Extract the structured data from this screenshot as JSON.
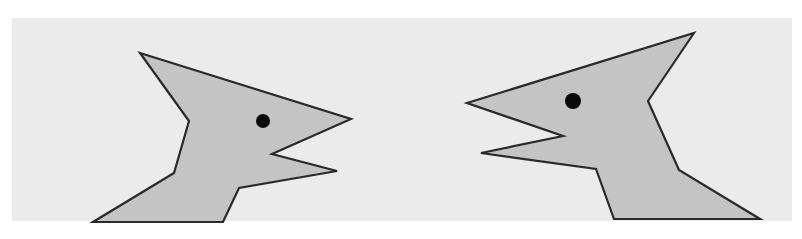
{
  "scene": {
    "description": "Two stylized angular bird-like heads facing each other with open beaks",
    "colors": {
      "page_background": "#ffffff",
      "panel_background": "#ebebeb",
      "figure_fill": "#c4c4c4",
      "outline": "#2a2a2a",
      "eye": "#0a0a0a"
    },
    "figures": [
      {
        "id": "left-head",
        "facing": "right",
        "points": "140,53 351,119 272,154 337,171 239,188 223,222 93,222 174,173 189,121",
        "eye": {
          "cx": 263,
          "cy": 121,
          "r": 7
        }
      },
      {
        "id": "right-head",
        "facing": "left",
        "points": "694,33 648,101 679,170 760,219 614,219 596,169 481,153 563,136 467,103",
        "eye": {
          "cx": 573,
          "cy": 101,
          "r": 8
        }
      }
    ]
  }
}
